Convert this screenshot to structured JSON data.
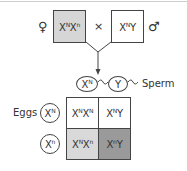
{
  "diagram": {
    "type": "punnett_square_x_linked_cross",
    "parents": {
      "female": {
        "symbol": "♀",
        "genotype_base1": "X",
        "sup1": "N",
        "genotype_base2": "X",
        "sup2": "n",
        "fill": "#d6d6d6"
      },
      "cross_symbol": "×",
      "male": {
        "symbol": "♂",
        "genotype_base1": "X",
        "sup1": "N",
        "genotype_base2": "Y",
        "fill": "#ffffff"
      }
    },
    "sperm": {
      "label": "Sperm",
      "gametes": [
        {
          "base": "X",
          "sup": "N"
        },
        {
          "base": "Y",
          "sup": ""
        }
      ]
    },
    "eggs": {
      "label": "Eggs",
      "gametes": [
        {
          "base": "X",
          "sup": "N"
        },
        {
          "base": "X",
          "sup": "n"
        }
      ]
    },
    "grid": {
      "rows": [
        [
          {
            "b1": "X",
            "s1": "N",
            "b2": "X",
            "s2": "N",
            "fill": "#ffffff"
          },
          {
            "b1": "X",
            "s1": "N",
            "b2": "Y",
            "s2": "",
            "fill": "#ffffff"
          }
        ],
        [
          {
            "b1": "X",
            "s1": "N",
            "b2": "X",
            "s2": "n",
            "fill": "#d9d9d9"
          },
          {
            "b1": "X",
            "s1": "n",
            "b2": "Y",
            "s2": "",
            "fill": "#9a9a9a"
          }
        ]
      ]
    }
  }
}
